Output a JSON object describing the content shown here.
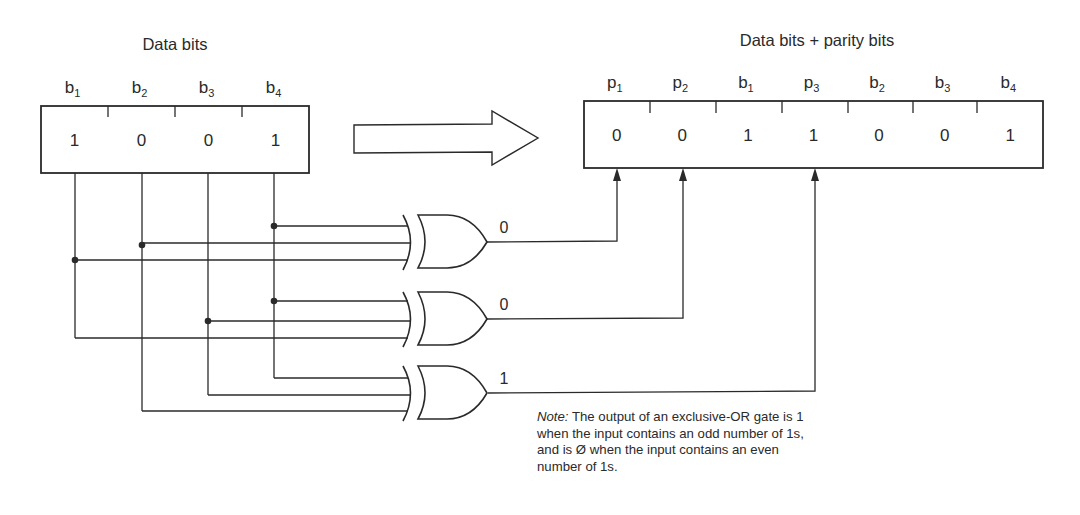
{
  "left_register": {
    "title": "Data bits",
    "cells": [
      {
        "name": "b",
        "sub": "1",
        "value": "1"
      },
      {
        "name": "b",
        "sub": "2",
        "value": "0"
      },
      {
        "name": "b",
        "sub": "3",
        "value": "0"
      },
      {
        "name": "b",
        "sub": "4",
        "value": "1"
      }
    ]
  },
  "right_register": {
    "title": "Data bits + parity bits",
    "cells": [
      {
        "name": "p",
        "sub": "1",
        "value": "0"
      },
      {
        "name": "p",
        "sub": "2",
        "value": "0"
      },
      {
        "name": "b",
        "sub": "1",
        "value": "1"
      },
      {
        "name": "p",
        "sub": "3",
        "value": "1"
      },
      {
        "name": "b",
        "sub": "2",
        "value": "0"
      },
      {
        "name": "b",
        "sub": "3",
        "value": "0"
      },
      {
        "name": "b",
        "sub": "4",
        "value": "1"
      }
    ]
  },
  "transform_arrow": "right-arrow-icon",
  "gates": [
    {
      "type": "XOR",
      "inputs": [
        "b4",
        "b2",
        "b1"
      ],
      "output": "0",
      "target": "p1"
    },
    {
      "type": "XOR",
      "inputs": [
        "b4",
        "b3",
        "b1"
      ],
      "output": "0",
      "target": "p2"
    },
    {
      "type": "XOR",
      "inputs": [
        "b4",
        "b3",
        "b2"
      ],
      "output": "1",
      "target": "p3"
    }
  ],
  "note": {
    "label": "Note:",
    "text": " The output of an exclusive-OR gate is 1 when the input contains an odd number of 1s, and is Ø when the input contains an even number of 1s."
  }
}
